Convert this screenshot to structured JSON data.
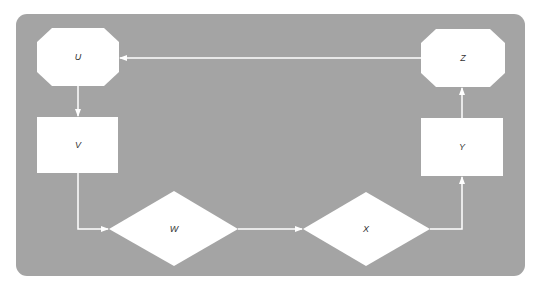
{
  "diagram": {
    "background": "#a4a4a4",
    "node_fill": "#ffffff",
    "edge_color": "#ffffff",
    "nodes": [
      {
        "id": "U",
        "label": "U",
        "shape": "octagon"
      },
      {
        "id": "V",
        "label": "V",
        "shape": "rectangle"
      },
      {
        "id": "W",
        "label": "W",
        "shape": "diamond"
      },
      {
        "id": "X",
        "label": "X",
        "shape": "diamond"
      },
      {
        "id": "Y",
        "label": "Y",
        "shape": "rectangle"
      },
      {
        "id": "Z",
        "label": "Z",
        "shape": "octagon"
      }
    ],
    "edges": [
      {
        "from": "U",
        "to": "V"
      },
      {
        "from": "V",
        "to": "W"
      },
      {
        "from": "W",
        "to": "X"
      },
      {
        "from": "X",
        "to": "Y"
      },
      {
        "from": "Y",
        "to": "Z"
      },
      {
        "from": "Z",
        "to": "U"
      }
    ]
  }
}
